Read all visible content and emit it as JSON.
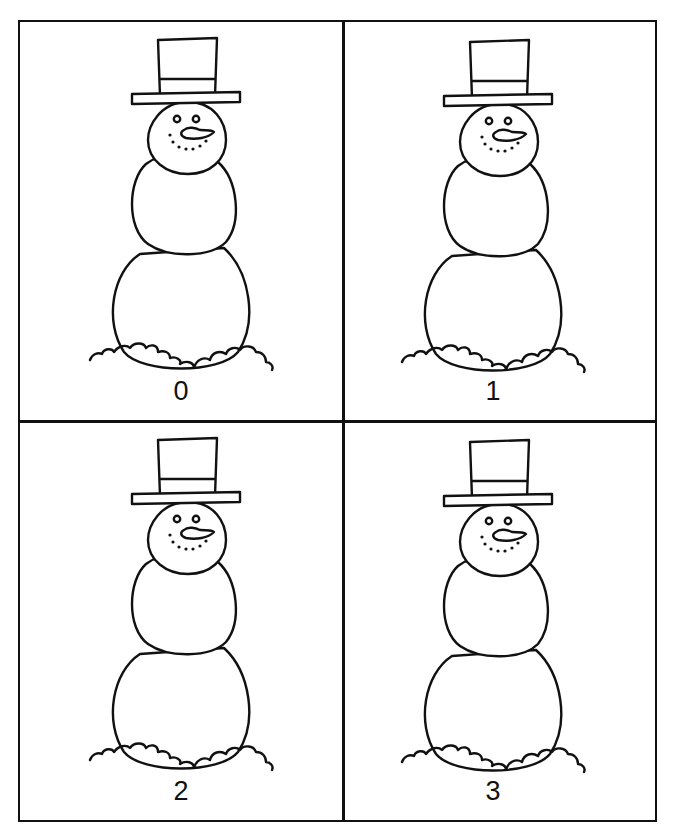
{
  "worksheet": {
    "cards": [
      {
        "label": "0",
        "picture": "snowman"
      },
      {
        "label": "1",
        "picture": "snowman"
      },
      {
        "label": "2",
        "picture": "snowman"
      },
      {
        "label": "3",
        "picture": "snowman"
      }
    ],
    "colors": {
      "line": "#111111",
      "background": "#ffffff"
    }
  }
}
